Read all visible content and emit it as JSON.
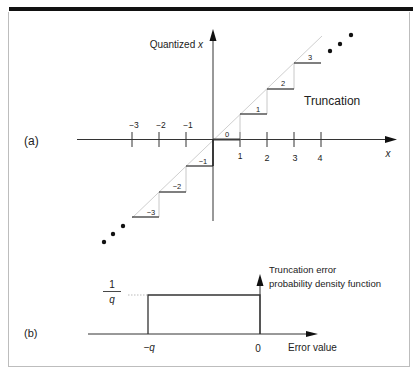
{
  "panel_a": {
    "label": "(a)",
    "y_axis_label": "Quantized ",
    "y_axis_var": "x",
    "x_axis_label": "x",
    "curve_label": "Truncation",
    "x_ticks_negative": [
      "−3",
      "−2",
      "−1"
    ],
    "x_ticks_positive": [
      "1",
      "2",
      "3",
      "4"
    ],
    "step_labels": {
      "s0": "0",
      "s1": "1",
      "s2": "2",
      "s3": "3",
      "sm1": "−1",
      "sm2": "−2",
      "sm3": "−3"
    }
  },
  "panel_b": {
    "label": "(b)",
    "y_value_numerator": "1",
    "y_value_denominator": "q",
    "pdf_label_line1": "Truncation error",
    "pdf_label_line2": "probability density function",
    "x_left": "−q",
    "x_right": "0",
    "x_axis_label": "Error value"
  },
  "colors": {
    "axis": "#222222",
    "step": "#3a3a3a",
    "diagonal": "#cfcfcf",
    "riser": "#c8c8c8",
    "frame": "#bdbdbd"
  }
}
